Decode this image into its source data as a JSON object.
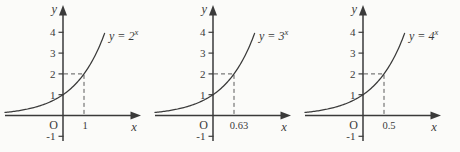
{
  "figure": {
    "background": "#fbfbf9",
    "ink": "#3a3a3a",
    "dash_color": "#5a5a5a"
  },
  "chart_data": [
    {
      "id": "y-equals-2-to-x",
      "type": "line",
      "title": "y = 2^x",
      "base": 2,
      "label_prefix": "y = 2",
      "label_sup": "x",
      "xlabel": "x",
      "ylabel": "y",
      "origin_label": "O",
      "y_ticks": [
        {
          "value": 4,
          "label": "4"
        },
        {
          "value": 3,
          "label": "3"
        },
        {
          "value": 2,
          "label": "2"
        },
        {
          "value": 1,
          "label": "1"
        },
        {
          "value": -1,
          "label": "-1"
        }
      ],
      "x_tick": {
        "value": 1,
        "label": "1"
      },
      "guide_point": {
        "x": 1,
        "y": 2
      },
      "key_points": [
        {
          "x": 0,
          "y": 1
        },
        {
          "x": 1,
          "y": 2
        }
      ],
      "xlim": [
        -2.7,
        3.7
      ],
      "ylim": [
        -1.7,
        5.3
      ],
      "grid": false,
      "dashed_guides": true
    },
    {
      "id": "y-equals-3-to-x",
      "type": "line",
      "title": "y = 3^x",
      "base": 3,
      "label_prefix": "y = 3",
      "label_sup": "x",
      "xlabel": "x",
      "ylabel": "y",
      "origin_label": "O",
      "y_ticks": [
        {
          "value": 4,
          "label": "4"
        },
        {
          "value": 3,
          "label": "3"
        },
        {
          "value": 2,
          "label": "2"
        },
        {
          "value": 1,
          "label": "1"
        },
        {
          "value": -1,
          "label": "-1"
        }
      ],
      "x_tick": {
        "value": 0.63,
        "label": "0.63"
      },
      "guide_point": {
        "x": 0.63,
        "y": 2
      },
      "key_points": [
        {
          "x": 0,
          "y": 1
        },
        {
          "x": 0.63,
          "y": 2
        }
      ],
      "xlim": [
        -1.7,
        2.3
      ],
      "ylim": [
        -1.7,
        5.3
      ],
      "grid": false,
      "dashed_guides": true
    },
    {
      "id": "y-equals-4-to-x",
      "type": "line",
      "title": "y = 4^x",
      "base": 4,
      "label_prefix": "y = 4",
      "label_sup": "x",
      "xlabel": "x",
      "ylabel": "y",
      "origin_label": "O",
      "y_ticks": [
        {
          "value": 4,
          "label": "4"
        },
        {
          "value": 3,
          "label": "3"
        },
        {
          "value": 2,
          "label": "2"
        },
        {
          "value": 1,
          "label": "1"
        },
        {
          "value": -1,
          "label": "-1"
        }
      ],
      "x_tick": {
        "value": 0.5,
        "label": "0.5"
      },
      "guide_point": {
        "x": 0.5,
        "y": 2
      },
      "key_points": [
        {
          "x": 0,
          "y": 1
        },
        {
          "x": 0.5,
          "y": 2
        }
      ],
      "xlim": [
        -1.35,
        1.85
      ],
      "ylim": [
        -1.7,
        5.3
      ],
      "grid": false,
      "dashed_guides": true
    }
  ]
}
